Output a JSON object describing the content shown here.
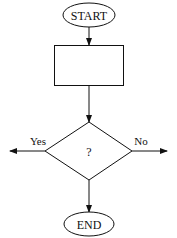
{
  "diagram": {
    "type": "flowchart",
    "nodes": {
      "start": {
        "label": "START",
        "shape": "ellipse"
      },
      "process": {
        "label": "",
        "shape": "rectangle"
      },
      "decision": {
        "label": "?",
        "shape": "diamond"
      },
      "end": {
        "label": "END",
        "shape": "ellipse"
      }
    },
    "edges": {
      "start_to_process": {
        "from": "START",
        "to": "process",
        "label": ""
      },
      "process_to_decision": {
        "from": "process",
        "to": "?",
        "label": ""
      },
      "decision_yes": {
        "from": "?",
        "to": "left",
        "label": "Yes"
      },
      "decision_no": {
        "from": "?",
        "to": "right",
        "label": "No"
      },
      "decision_to_end": {
        "from": "?",
        "to": "END",
        "label": ""
      }
    },
    "colors": {
      "stroke": "#111111",
      "background": "#ffffff"
    }
  }
}
